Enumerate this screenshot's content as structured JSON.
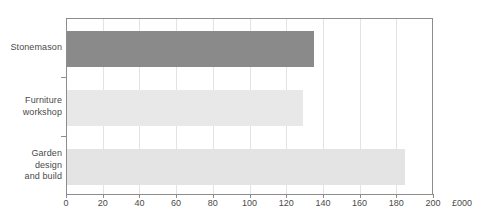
{
  "chart_data": {
    "type": "bar",
    "orientation": "horizontal",
    "title": "",
    "subtitle": "",
    "xlabel": "£000",
    "ylabel": "",
    "categories": [
      "Stonemason",
      "Furniture workshop",
      "Garden design and build"
    ],
    "values": [
      135,
      129,
      185
    ],
    "series": [
      {
        "name": "Turnover",
        "values": [
          135,
          129,
          185
        ]
      }
    ],
    "xlim": [
      0,
      200
    ],
    "xticks": [
      0,
      20,
      40,
      60,
      80,
      100,
      120,
      140,
      160,
      180,
      200
    ],
    "xtick_labels": [
      "0",
      "20",
      "40",
      "60",
      "80",
      "100",
      "120",
      "140",
      "160",
      "180",
      "200"
    ],
    "grid": "vertical",
    "legend": "none",
    "annotations": [],
    "bar_colors": [
      "#8a8a8a",
      "#e8e8e8",
      "#e4e4e4"
    ]
  },
  "axis": {
    "unit_label": "£000",
    "line_color": "#8d8d8d",
    "gridline_color": "#e3e3e3",
    "tick_text_color": "#4a4a4a"
  },
  "categories": [
    {
      "id": "stonemason",
      "lines": [
        "Stonemason"
      ],
      "value": 135,
      "color": "#8a8a8a"
    },
    {
      "id": "furniture-workshop",
      "lines": [
        "Furniture",
        "workshop"
      ],
      "value": 129,
      "color": "#e8e8e8"
    },
    {
      "id": "garden-design",
      "lines": [
        "Garden",
        "design",
        "and build"
      ],
      "value": 185,
      "color": "#e4e4e4"
    }
  ],
  "ticks": [
    {
      "value": 0,
      "label": "0"
    },
    {
      "value": 20,
      "label": "20"
    },
    {
      "value": 40,
      "label": "40"
    },
    {
      "value": 60,
      "label": "60"
    },
    {
      "value": 80,
      "label": "80"
    },
    {
      "value": 100,
      "label": "100"
    },
    {
      "value": 120,
      "label": "120"
    },
    {
      "value": 140,
      "label": "140"
    },
    {
      "value": 160,
      "label": "160"
    },
    {
      "value": 180,
      "label": "180"
    },
    {
      "value": 200,
      "label": "200"
    }
  ]
}
